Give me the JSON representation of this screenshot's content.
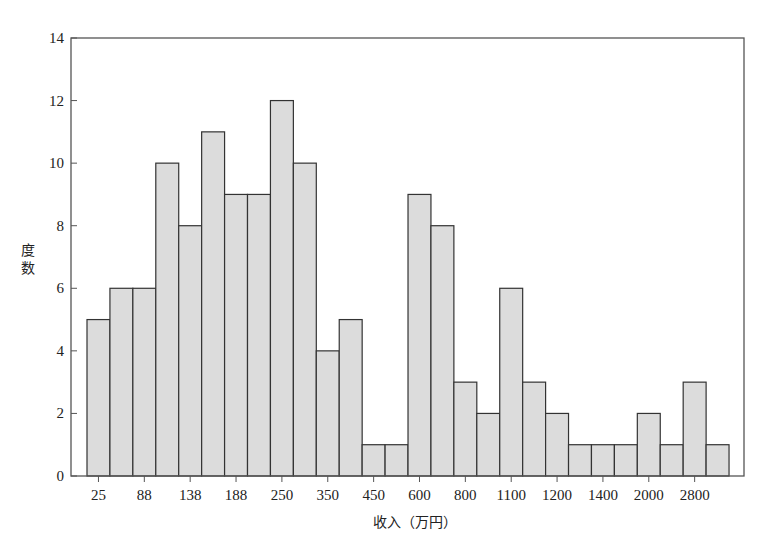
{
  "chart_data": {
    "type": "bar",
    "title": "",
    "xlabel": "收入（万円）",
    "ylabel": "度数",
    "ylim": [
      0,
      14
    ],
    "yticks": [
      0,
      2,
      4,
      6,
      8,
      10,
      12,
      14
    ],
    "xtick_labels": [
      "25",
      "88",
      "138",
      "188",
      "250",
      "350",
      "450",
      "600",
      "800",
      "1100",
      "1200",
      "1400",
      "2000",
      "2800"
    ],
    "grid": false,
    "legend": null,
    "bar_fill": "#dcdcdc",
    "bar_edge": "#333333",
    "values": [
      5,
      6,
      6,
      10,
      8,
      11,
      9,
      9,
      12,
      10,
      4,
      5,
      1,
      1,
      9,
      8,
      3,
      2,
      6,
      3,
      2,
      1,
      1,
      1,
      2,
      1,
      3,
      1
    ]
  },
  "labels": {
    "y_axis_title_line1": "度",
    "y_axis_title_line2": "数",
    "x_axis_title": "收入（万円）"
  }
}
